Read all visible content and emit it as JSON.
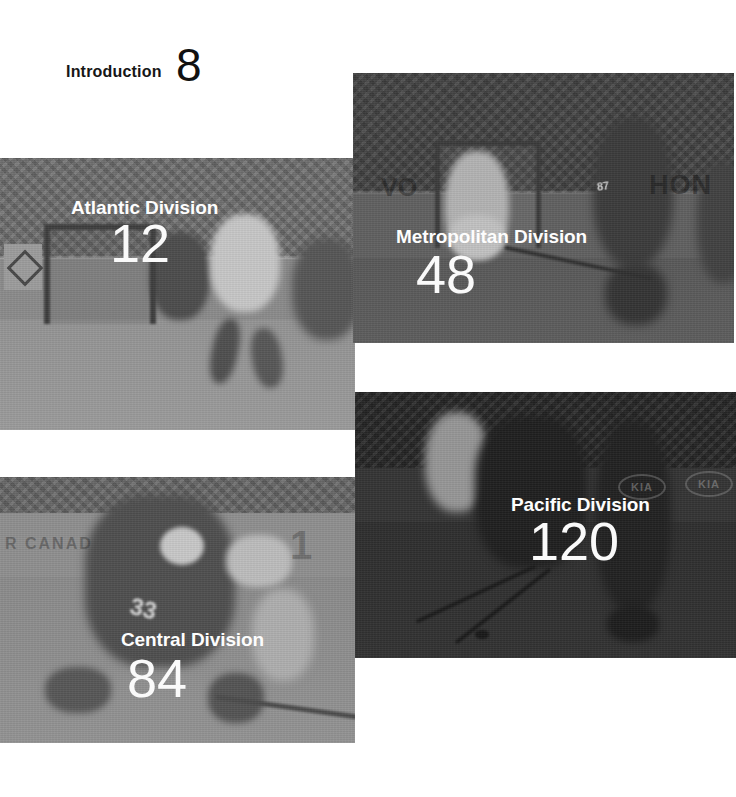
{
  "intro": {
    "label": "Introduction",
    "page_number": "8"
  },
  "divisions": [
    {
      "id": "atlantic",
      "title": "Atlantic Division",
      "page_number": "12",
      "photo_tone": "#8e8e8e",
      "photo_alt": "faded gray photo of goal-crease scramble in front of hockey net"
    },
    {
      "id": "metropolitan",
      "title": "Metropolitan Division",
      "page_number": "48",
      "photo_tone": "#585858",
      "photo_alt": "dark gray photo of goalie in net and skater cutting across crease"
    },
    {
      "id": "central",
      "title": "Central Division",
      "page_number": "84",
      "photo_tone": "#888888",
      "photo_alt": "gray photo of two players battling along the ice"
    },
    {
      "id": "pacific",
      "title": "Pacific Division",
      "page_number": "120",
      "photo_tone": "#2f2f2f",
      "photo_alt": "very dark photo of players and sticks by the boards"
    }
  ],
  "photo_text": {
    "metropolitan_board_left": "VO",
    "metropolitan_board_right": "HON",
    "metropolitan_jersey_number": "87",
    "central_board_left": "R CANAD",
    "central_board_digit": "1",
    "central_jersey_number": "33",
    "pacific_board_logo": "KIA"
  },
  "colors": {
    "page_background": "#ffffff",
    "intro_text": "#161616",
    "panel_text": "#ffffff"
  }
}
